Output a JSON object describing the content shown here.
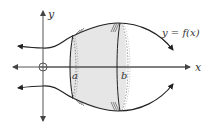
{
  "figure": {
    "curve_label": "y = f(x)",
    "axes": {
      "x_label": "x",
      "y_label": "y",
      "origin_marker": "O"
    },
    "bounds": {
      "lower_label": "a",
      "upper_label": "b"
    },
    "colors": {
      "stroke": "#222222",
      "axis": "#555555",
      "solid_fill": "#e6e6e6",
      "background": "#ffffff"
    }
  }
}
